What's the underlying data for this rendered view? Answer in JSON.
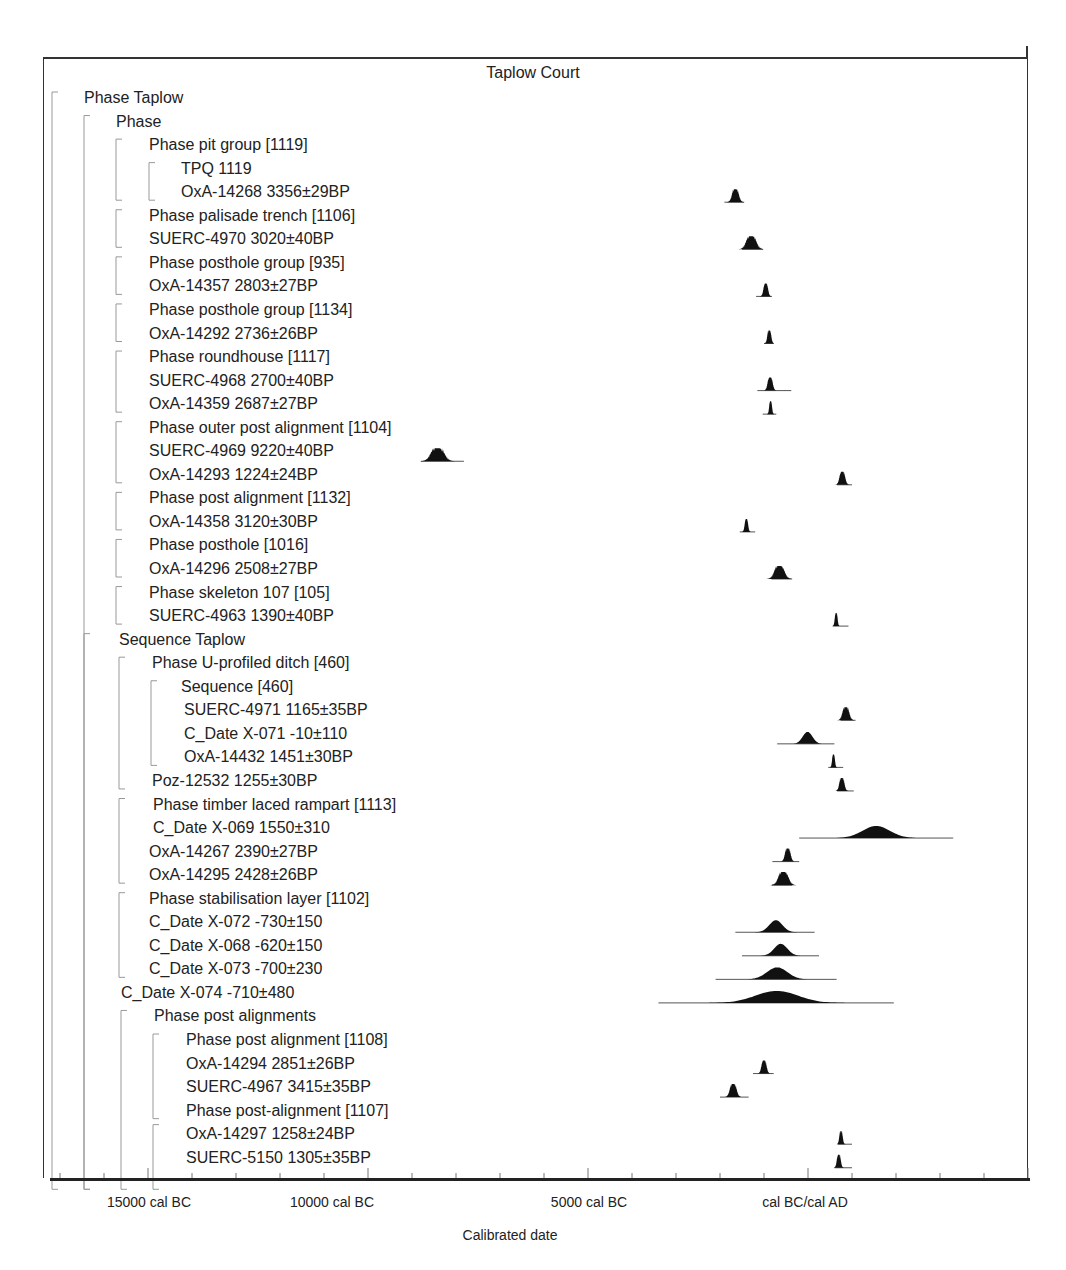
{
  "chart_data": {
    "type": "multiplot-probability",
    "title": "Taplow Court",
    "xlabel": "Calibrated date",
    "x_ticks_labels": [
      "15000 cal BC",
      "10000 cal BC",
      "5000 cal BC",
      "cal BC/cal AD"
    ],
    "x_tick_values": [
      -15000,
      -10000,
      -5000,
      0
    ],
    "xlim": [
      -17200,
      5000
    ],
    "minor_tick_step": 1000,
    "rows": [
      {
        "label": "Phase Taplow",
        "indent": 0,
        "bracket": 0
      },
      {
        "label": "Phase",
        "indent": 1
      },
      {
        "label": "Phase pit group [1119]",
        "indent": 2
      },
      {
        "label": "TPQ 1119",
        "indent": 3
      },
      {
        "label": "OxA-14268  3356±29BP",
        "indent": 3,
        "dist": {
          "center": -1650,
          "spread": 60,
          "lo": -1900,
          "hi": -1450,
          "shape": "spiky"
        }
      },
      {
        "label": "Phase palisade trench [1106]",
        "indent": 2
      },
      {
        "label": "SUERC-4970  3020±40BP",
        "indent": 2,
        "dist": {
          "center": -1290,
          "spread": 90,
          "lo": -1500,
          "hi": -1020,
          "shape": "spiky"
        }
      },
      {
        "label": "Phase posthole group [935]",
        "indent": 2
      },
      {
        "label": "OxA-14357  2803±27BP",
        "indent": 2,
        "dist": {
          "center": -960,
          "spread": 40,
          "lo": -1180,
          "hi": -820,
          "shape": "spiky"
        }
      },
      {
        "label": "Phase posthole group [1134]",
        "indent": 2
      },
      {
        "label": "OxA-14292  2736±26BP",
        "indent": 2,
        "dist": {
          "center": -880,
          "spread": 35,
          "lo": -1000,
          "hi": -780,
          "shape": "spiky"
        }
      },
      {
        "label": "Phase roundhouse  [1117]",
        "indent": 2
      },
      {
        "label": "SUERC-4968  2700±40BP",
        "indent": 2,
        "dist": {
          "center": -860,
          "spread": 45,
          "lo": -1150,
          "hi": -380,
          "shape": "spiky"
        }
      },
      {
        "label": "OxA-14359  2687±27BP",
        "indent": 2,
        "dist": {
          "center": -850,
          "spread": 25,
          "lo": -1030,
          "hi": -720,
          "shape": "spiky"
        }
      },
      {
        "label": "Phase outer post alignment [1104]",
        "indent": 2
      },
      {
        "label": "SUERC-4969  9220±40BP",
        "indent": 2,
        "dist": {
          "center": -8420,
          "spread": 120,
          "lo": -8800,
          "hi": -7820,
          "shape": "spiky"
        }
      },
      {
        "label": "OxA-14293  1224±24BP",
        "indent": 2,
        "dist": {
          "center": 780,
          "spread": 50,
          "lo": 660,
          "hi": 1000,
          "shape": "spiky"
        }
      },
      {
        "label": "Phase post alignment [1132]",
        "indent": 2
      },
      {
        "label": "OxA-14358  3120±30BP",
        "indent": 2,
        "dist": {
          "center": -1400,
          "spread": 30,
          "lo": -1550,
          "hi": -1200,
          "shape": "spiky"
        }
      },
      {
        "label": "Phase posthole [1016]",
        "indent": 2
      },
      {
        "label": "OxA-14296  2508±27BP",
        "indent": 2,
        "dist": {
          "center": -650,
          "spread": 90,
          "lo": -830,
          "hi": -360,
          "shape": "spiky"
        }
      },
      {
        "label": "Phase skeleton 107 [105]",
        "indent": 2
      },
      {
        "label": "SUERC-4963  1390±40BP",
        "indent": 2,
        "dist": {
          "center": 640,
          "spread": 25,
          "lo": 560,
          "hi": 920,
          "shape": "spiky"
        }
      },
      {
        "label": "Sequence Taplow",
        "indent": 1
      },
      {
        "label": "Phase U-profiled ditch [460]",
        "indent": 2
      },
      {
        "label": "Sequence [460]",
        "indent": 3
      },
      {
        "label": "SUERC-4971  1165±35BP",
        "indent": 3,
        "dist": {
          "center": 860,
          "spread": 60,
          "lo": 740,
          "hi": 1080,
          "shape": "spiky"
        }
      },
      {
        "label": "C_Date X-071  -10±110",
        "indent": 3,
        "dist": {
          "center": -10,
          "spread": 110,
          "lo": -700,
          "hi": 600,
          "shape": "normal"
        }
      },
      {
        "label": "OxA-14432  1451±30BP",
        "indent": 3,
        "dist": {
          "center": 580,
          "spread": 25,
          "lo": 460,
          "hi": 800,
          "shape": "spiky"
        }
      },
      {
        "label": "Poz-12532  1255±30BP",
        "indent": 2,
        "dist": {
          "center": 770,
          "spread": 45,
          "lo": 660,
          "hi": 1040,
          "shape": "spiky"
        }
      },
      {
        "label": "Phase timber laced rampart [1113]",
        "indent": 2
      },
      {
        "label": "C_Date X-069  1550±310",
        "indent": 2,
        "dist": {
          "center": 1550,
          "spread": 310,
          "lo": -200,
          "hi": 3300,
          "shape": "normal"
        }
      },
      {
        "label": "OxA-14267  2390±27BP",
        "indent": 2,
        "dist": {
          "center": -460,
          "spread": 50,
          "lo": -810,
          "hi": -200,
          "shape": "spiky"
        }
      },
      {
        "label": "OxA-14295  2428±26BP",
        "indent": 2,
        "dist": {
          "center": -560,
          "spread": 90,
          "lo": -820,
          "hi": -360,
          "shape": "spiky"
        }
      },
      {
        "label": "Phase stabilisation layer [1102]",
        "indent": 2
      },
      {
        "label": "C_Date X-072  -730±150",
        "indent": 2,
        "dist": {
          "center": -730,
          "spread": 150,
          "lo": -1650,
          "hi": 150,
          "shape": "normal"
        }
      },
      {
        "label": "C_Date X-068  -620±150",
        "indent": 2,
        "dist": {
          "center": -620,
          "spread": 150,
          "lo": -1500,
          "hi": 250,
          "shape": "normal"
        }
      },
      {
        "label": "C_Date X-073  -700±230",
        "indent": 2,
        "dist": {
          "center": -700,
          "spread": 230,
          "lo": -2100,
          "hi": 650,
          "shape": "normal"
        }
      },
      {
        "label": "C_Date X-074  -710±480",
        "indent": 1,
        "dist": {
          "center": -710,
          "spread": 480,
          "lo": -3400,
          "hi": 1950,
          "shape": "normal"
        }
      },
      {
        "label": "Phase post alignments",
        "indent": 2
      },
      {
        "label": "Phase post alignment [1108]",
        "indent": 3
      },
      {
        "label": "OxA-14294  2851±26BP",
        "indent": 3,
        "dist": {
          "center": -1000,
          "spread": 45,
          "lo": -1250,
          "hi": -780,
          "shape": "spiky"
        }
      },
      {
        "label": "SUERC-4967  3415±35BP",
        "indent": 3,
        "dist": {
          "center": -1700,
          "spread": 60,
          "lo": -2000,
          "hi": -1350,
          "shape": "spiky"
        }
      },
      {
        "label": "Phase post-alignment [1107]",
        "indent": 3
      },
      {
        "label": "OxA-14297  1258±24BP",
        "indent": 3,
        "dist": {
          "center": 750,
          "spread": 30,
          "lo": 680,
          "hi": 1000,
          "shape": "spiky"
        }
      },
      {
        "label": "SUERC-5150  1305±35BP",
        "indent": 3,
        "dist": {
          "center": 700,
          "spread": 35,
          "lo": 600,
          "hi": 1000,
          "shape": "spiky"
        }
      }
    ]
  },
  "colors": {
    "ink": "#111111",
    "bracket": "#999999",
    "baseline": "#555555"
  }
}
